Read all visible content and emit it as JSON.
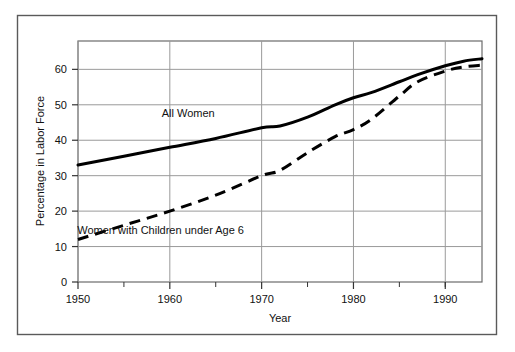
{
  "figure": {
    "outer_border_color": "#555555",
    "background_color": "#ffffff"
  },
  "chart_data": {
    "type": "line",
    "title": "",
    "subtitle": "",
    "xlabel": "Year",
    "ylabel": "Percentage in Labor Force",
    "xlim": [
      1950,
      1994
    ],
    "ylim": [
      0,
      68
    ],
    "grid": true,
    "grid_axis": "both",
    "legend_position": "inline-annotation",
    "x_major_ticks": [
      1950,
      1960,
      1970,
      1980,
      1990
    ],
    "x_major_tick_labels": [
      "1950",
      "1960",
      "1970",
      "1980",
      "1990"
    ],
    "x_minor_ticks": [
      1955,
      1965,
      1975,
      1985,
      1990
    ],
    "y_ticks": [
      0,
      10,
      20,
      30,
      40,
      50,
      60
    ],
    "y_tick_labels": [
      "0",
      "10",
      "20",
      "30",
      "40",
      "50",
      "60"
    ],
    "series": [
      {
        "name": "All Women",
        "style": "solid",
        "color": "#000000",
        "line_width": 3,
        "label_x": 1962,
        "label_y": 46.5,
        "x": [
          1950,
          1955,
          1960,
          1965,
          1970,
          1972,
          1975,
          1978,
          1980,
          1982,
          1985,
          1987,
          1990,
          1992,
          1994
        ],
        "values": [
          33.0,
          35.5,
          38.0,
          40.5,
          43.5,
          44.0,
          46.5,
          50.0,
          52.0,
          53.5,
          56.5,
          58.5,
          61.0,
          62.3,
          63.0
        ]
      },
      {
        "name": "Women with Children under Age 6",
        "style": "dashed",
        "color": "#000000",
        "line_width": 3,
        "label_x": 1959,
        "label_y": 13.5,
        "x": [
          1950,
          1955,
          1960,
          1965,
          1970,
          1972,
          1975,
          1978,
          1980,
          1982,
          1985,
          1987,
          1990,
          1992,
          1994
        ],
        "values": [
          12.0,
          16.0,
          20.0,
          24.5,
          30.0,
          31.5,
          36.5,
          41.0,
          43.0,
          46.0,
          52.5,
          56.5,
          59.5,
          60.7,
          61.2
        ]
      }
    ]
  },
  "annotations": {
    "all_women_label": "All Women",
    "children_label": "Women with Children under Age 6"
  },
  "axes": {
    "x_title": "Year",
    "y_title": "Percentage in Labor Force"
  }
}
